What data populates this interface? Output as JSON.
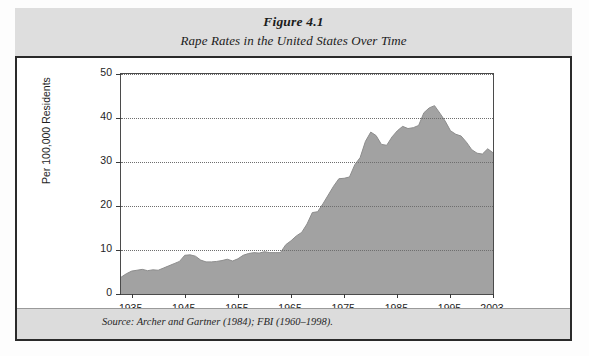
{
  "figure": {
    "number": "Figure 4.1",
    "title": "Rape Rates in the United States Over Time",
    "source_note": "Source:  Archer and Gartner (1984); FBI (1960–1998)."
  },
  "colors": {
    "caption_band": "#dedede",
    "source_band": "#dcdcdc",
    "border": "#2a2a2a",
    "area_fill": "#a2a2a2",
    "area_stroke": "#8d8d8d",
    "gridline": "#6e6e6e",
    "text": "#1e1e1e"
  },
  "chart_data": {
    "type": "area",
    "title": "Rape Rates in the United States Over Time",
    "xlabel": "",
    "ylabel": "Per 100,000 Residents",
    "xlim": [
      1933,
      2003
    ],
    "ylim": [
      0,
      50
    ],
    "ytick_labels": [
      "0",
      "10",
      "20",
      "30",
      "40",
      "50"
    ],
    "yticks": [
      0,
      10,
      20,
      30,
      40,
      50
    ],
    "xtick_labels": [
      "1935",
      "1945",
      "1955",
      "1965",
      "1975",
      "1985",
      "1995",
      "2003"
    ],
    "xticks": [
      1935,
      1945,
      1955,
      1965,
      1975,
      1985,
      1995,
      2003
    ],
    "grid": "horizontal-dotted",
    "legend": "none",
    "series_name": "Rape rate per 100,000 residents",
    "x": [
      1933,
      1934,
      1935,
      1936,
      1937,
      1938,
      1939,
      1940,
      1941,
      1942,
      1943,
      1944,
      1945,
      1946,
      1947,
      1948,
      1949,
      1950,
      1951,
      1952,
      1953,
      1954,
      1955,
      1956,
      1957,
      1958,
      1959,
      1960,
      1961,
      1962,
      1963,
      1964,
      1965,
      1966,
      1967,
      1968,
      1969,
      1970,
      1971,
      1972,
      1973,
      1974,
      1975,
      1976,
      1977,
      1978,
      1979,
      1980,
      1981,
      1982,
      1983,
      1984,
      1985,
      1986,
      1987,
      1988,
      1989,
      1990,
      1991,
      1992,
      1993,
      1994,
      1995,
      1996,
      1997,
      1998,
      1999,
      2000,
      2001,
      2002,
      2003
    ],
    "values": [
      3.8,
      4.6,
      5.2,
      5.4,
      5.6,
      5.3,
      5.5,
      5.4,
      5.9,
      6.4,
      6.9,
      7.4,
      8.8,
      8.9,
      8.6,
      7.7,
      7.3,
      7.3,
      7.4,
      7.6,
      7.9,
      7.5,
      8.0,
      8.8,
      9.2,
      9.4,
      9.3,
      9.6,
      9.4,
      9.4,
      9.4,
      11.2,
      12.1,
      13.2,
      14.0,
      15.9,
      18.5,
      18.7,
      20.5,
      22.5,
      24.5,
      26.2,
      26.3,
      26.6,
      29.4,
      31.0,
      34.7,
      36.8,
      36.0,
      34.0,
      33.8,
      35.7,
      37.1,
      38.1,
      37.6,
      37.8,
      38.3,
      41.2,
      42.3,
      42.8,
      41.1,
      39.3,
      37.1,
      36.3,
      35.9,
      34.5,
      32.8,
      32.0,
      31.8,
      33.0,
      32.1
    ]
  }
}
